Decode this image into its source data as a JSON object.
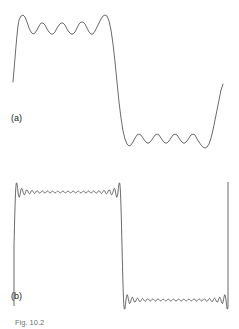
{
  "figure": {
    "caption": "Fig. 10.2",
    "panels": [
      {
        "id": "a",
        "label": "(a)"
      },
      {
        "id": "b",
        "label": "(b)"
      }
    ],
    "line_color": "#5a5a5a",
    "line_color_sharp": "#2a2a2a",
    "background_color": "#ffffff"
  },
  "chart_data": [
    {
      "type": "line",
      "id": "panel-a",
      "title": "(a)",
      "xlabel": "",
      "ylabel": "",
      "grid": false,
      "legend": null,
      "description": "Fourier series partial sum approximation of a square wave with a small number of harmonics; slow large-amplitude Gibbs ripples spread across both plateaus.",
      "xlim": [
        0,
        239
      ],
      "ylim": [
        170,
        0
      ],
      "square_wave": {
        "high_level": 26,
        "low_level": 140,
        "rising_edge_x": 14,
        "falling_edge_x": 118,
        "second_rising_edge_x": 228
      },
      "series": [
        {
          "name": "partial-sum-few-terms",
          "points": [
            [
              13,
              82
            ],
            [
              14,
              70
            ],
            [
              15,
              58
            ],
            [
              16,
              46
            ],
            [
              17,
              35
            ],
            [
              18,
              26
            ],
            [
              19,
              20
            ],
            [
              21,
              16
            ],
            [
              23,
              15
            ],
            [
              25,
              17
            ],
            [
              27,
              22
            ],
            [
              29,
              28
            ],
            [
              31,
              32
            ],
            [
              33,
              34
            ],
            [
              35,
              33
            ],
            [
              37,
              30
            ],
            [
              39,
              26
            ],
            [
              41,
              23
            ],
            [
              43,
              23
            ],
            [
              45,
              25
            ],
            [
              47,
              29
            ],
            [
              49,
              32
            ],
            [
              51,
              34
            ],
            [
              53,
              34
            ],
            [
              55,
              32
            ],
            [
              57,
              28
            ],
            [
              59,
              25
            ],
            [
              61,
              23
            ],
            [
              63,
              23
            ],
            [
              65,
              25
            ],
            [
              67,
              29
            ],
            [
              69,
              32
            ],
            [
              71,
              34
            ],
            [
              73,
              34
            ],
            [
              75,
              32
            ],
            [
              77,
              28
            ],
            [
              79,
              24
            ],
            [
              81,
              22
            ],
            [
              83,
              22
            ],
            [
              85,
              24
            ],
            [
              87,
              28
            ],
            [
              89,
              32
            ],
            [
              91,
              34
            ],
            [
              93,
              34
            ],
            [
              95,
              31
            ],
            [
              97,
              27
            ],
            [
              99,
              23
            ],
            [
              101,
              19
            ],
            [
              103,
              16
            ],
            [
              105,
              15
            ],
            [
              107,
              16
            ],
            [
              109,
              21
            ],
            [
              111,
              30
            ],
            [
              113,
              44
            ],
            [
              115,
              62
            ],
            [
              117,
              82
            ],
            [
              119,
              102
            ],
            [
              121,
              118
            ],
            [
              123,
              131
            ],
            [
              125,
              139
            ],
            [
              127,
              144
            ],
            [
              129,
              146
            ],
            [
              131,
              145
            ],
            [
              133,
              142
            ],
            [
              135,
              138
            ],
            [
              137,
              135
            ],
            [
              139,
              134
            ],
            [
              141,
              135
            ],
            [
              143,
              138
            ],
            [
              145,
              141
            ],
            [
              147,
              143
            ],
            [
              149,
              143
            ],
            [
              151,
              141
            ],
            [
              153,
              138
            ],
            [
              155,
              135
            ],
            [
              157,
              134
            ],
            [
              159,
              135
            ],
            [
              161,
              138
            ],
            [
              163,
              141
            ],
            [
              165,
              143
            ],
            [
              167,
              143
            ],
            [
              169,
              141
            ],
            [
              171,
              138
            ],
            [
              173,
              135
            ],
            [
              175,
              134
            ],
            [
              177,
              135
            ],
            [
              179,
              138
            ],
            [
              181,
              141
            ],
            [
              183,
              143
            ],
            [
              185,
              143
            ],
            [
              187,
              141
            ],
            [
              189,
              138
            ],
            [
              191,
              135
            ],
            [
              193,
              134
            ],
            [
              195,
              135
            ],
            [
              197,
              139
            ],
            [
              199,
              142
            ],
            [
              201,
              145
            ],
            [
              203,
              147
            ],
            [
              205,
              148
            ],
            [
              207,
              147
            ],
            [
              209,
              144
            ],
            [
              211,
              138
            ],
            [
              213,
              130
            ],
            [
              215,
              120
            ],
            [
              217,
              110
            ],
            [
              219,
              100
            ],
            [
              221,
              90
            ],
            [
              223,
              84
            ]
          ]
        }
      ]
    },
    {
      "type": "line",
      "id": "panel-b",
      "title": "(b)",
      "xlabel": "",
      "ylabel": "",
      "grid": false,
      "legend": null,
      "description": "Fourier series partial sum approximation of the same square wave with a large number of harmonics; the ringing is confined to narrow bands adjacent to the discontinuities while plateaus are nearly flat.",
      "xlim": [
        0,
        239
      ],
      "ylim": [
        140,
        0
      ],
      "square_wave": {
        "high_level": 22,
        "low_level": 130,
        "rising_edge_x": 14,
        "falling_edge_x": 122,
        "second_rising_edge_x": 228
      },
      "series": [
        {
          "name": "partial-sum-many-terms",
          "points": []
        }
      ]
    }
  ]
}
